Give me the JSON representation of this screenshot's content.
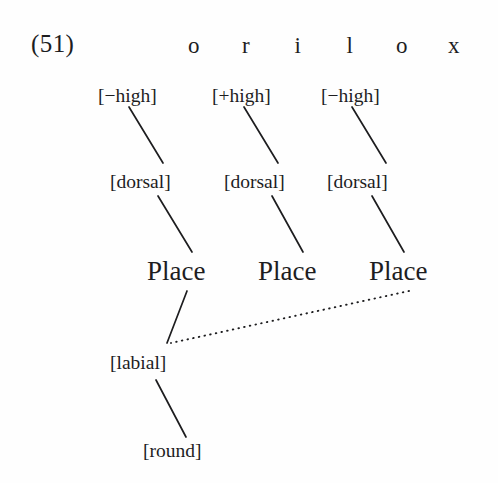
{
  "figure": {
    "example_number": "(51)",
    "caption": "",
    "ink_color": "#1d1d1f",
    "background_color": "#fefefe"
  },
  "segment_tier": {
    "name": "segmental-tier",
    "segments": [
      "o",
      "r",
      "i",
      "l",
      "o",
      "x"
    ]
  },
  "tiers": {
    "height_features": [
      {
        "label": "[−high]"
      },
      {
        "label": "[+high]"
      },
      {
        "label": "[−high]"
      }
    ],
    "dorsal_nodes": [
      {
        "label": "[dorsal]"
      },
      {
        "label": "[dorsal]"
      },
      {
        "label": "[dorsal]"
      }
    ],
    "place_nodes": [
      {
        "label": "Place"
      },
      {
        "label": "Place"
      },
      {
        "label": "Place"
      }
    ],
    "labial_node": {
      "label": "[labial]"
    },
    "round_node": {
      "label": "[round]"
    }
  },
  "association_lines": {
    "solid": [
      {
        "name": "high1-to-dorsal1",
        "x1": 129,
        "y1": 107,
        "x2": 163,
        "y2": 163
      },
      {
        "name": "high2-to-dorsal2",
        "x1": 244,
        "y1": 107,
        "x2": 278,
        "y2": 163
      },
      {
        "name": "high3-to-dorsal3",
        "x1": 352,
        "y1": 107,
        "x2": 386,
        "y2": 163
      },
      {
        "name": "dorsal1-to-place1",
        "x1": 158,
        "y1": 196,
        "x2": 192,
        "y2": 252
      },
      {
        "name": "dorsal2-to-place2",
        "x1": 272,
        "y1": 196,
        "x2": 303,
        "y2": 252
      },
      {
        "name": "dorsal3-to-place3",
        "x1": 372,
        "y1": 196,
        "x2": 404,
        "y2": 252
      },
      {
        "name": "place1-to-labial",
        "x1": 187,
        "y1": 291,
        "x2": 167,
        "y2": 343
      },
      {
        "name": "labial-to-round",
        "x1": 156,
        "y1": 380,
        "x2": 186,
        "y2": 437
      }
    ],
    "dotted": [
      {
        "name": "place3-spreading-to-labial",
        "x1": 409,
        "y1": 291,
        "x2": 171,
        "y2": 343
      }
    ]
  }
}
